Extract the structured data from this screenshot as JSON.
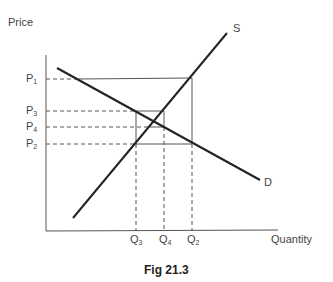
{
  "figure": {
    "caption": "Fig 21.3",
    "y_axis_label": "Price",
    "x_axis_label": "Quantity",
    "supply_label": "S",
    "demand_label": "D",
    "price_ticks": [
      {
        "base": "P",
        "sub": "1"
      },
      {
        "base": "P",
        "sub": "3"
      },
      {
        "base": "P",
        "sub": "4"
      },
      {
        "base": "P",
        "sub": "2"
      }
    ],
    "quantity_ticks": [
      {
        "base": "Q",
        "sub": "3"
      },
      {
        "base": "Q",
        "sub": "4"
      },
      {
        "base": "Q",
        "sub": "2"
      }
    ]
  }
}
